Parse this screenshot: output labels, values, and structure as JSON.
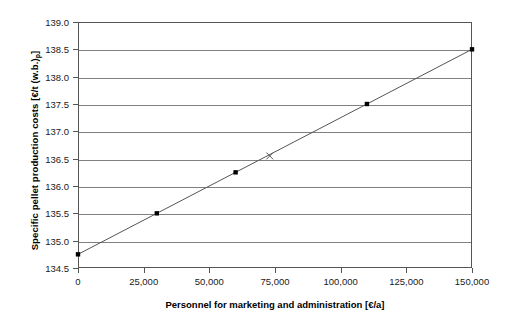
{
  "chart_data": {
    "type": "line",
    "title": "",
    "xlabel": "Personnel for marketing and administration [€/a]",
    "ylabel": "Specific pellet production costs [€/t (w.b.)p]",
    "ylabel_main": "Specific pellet production costs [€/t (w.b.)",
    "ylabel_sub": "p",
    "ylabel_tail": "]",
    "xlim": [
      0,
      150000
    ],
    "ylim": [
      134.5,
      139.0
    ],
    "grid": "horizontal",
    "legend": "none",
    "x": [
      0,
      30000,
      60000,
      110000,
      150000
    ],
    "values": [
      134.75,
      135.5,
      136.25,
      137.5,
      138.5
    ],
    "series": [
      {
        "name": "Specific pellet production costs",
        "marker": "square",
        "color": "#000000",
        "points": [
          {
            "x": 0,
            "y": 134.75
          },
          {
            "x": 30000,
            "y": 135.5
          },
          {
            "x": 60000,
            "y": 136.25
          },
          {
            "x": 110000,
            "y": 137.5
          },
          {
            "x": 150000,
            "y": 138.5
          }
        ]
      },
      {
        "name": "Base case",
        "marker": "x",
        "color": "#555555",
        "points": [
          {
            "x": 73000,
            "y": 136.55
          }
        ]
      }
    ],
    "xticks": [
      0,
      25000,
      50000,
      75000,
      100000,
      125000,
      150000
    ],
    "xticklabels": [
      "0",
      "25,000",
      "50,000",
      "75,000",
      "100,000",
      "125,000",
      "150,000"
    ],
    "yticks": [
      134.5,
      135.0,
      135.5,
      136.0,
      136.5,
      137.0,
      137.5,
      138.0,
      138.5,
      139.0
    ],
    "yticklabels": [
      "134.5",
      "135.0",
      "135.5",
      "136.0",
      "136.5",
      "137.0",
      "137.5",
      "138.0",
      "138.5",
      "139.0"
    ]
  },
  "colors": {
    "line": "#555555",
    "marker": "#000000",
    "grid": "#808080",
    "frame": "#555555",
    "background": "#ffffff",
    "text": "#1a1a1a"
  }
}
